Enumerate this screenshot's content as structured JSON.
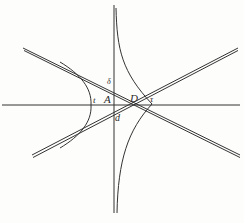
{
  "diagram": {
    "type": "geometric-figure",
    "stroke_color": "#333333",
    "background_color": "#fdfdfc",
    "labels": {
      "delta": "δ",
      "t": "t",
      "A": "A",
      "D": "D",
      "tau": "τ",
      "d": "d"
    }
  }
}
